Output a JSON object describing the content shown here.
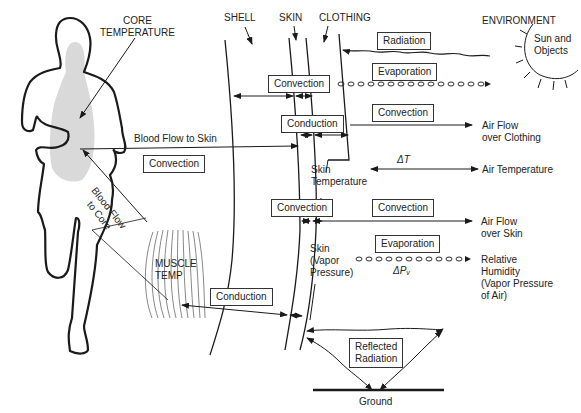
{
  "title_labels": {
    "core_temperature": [
      "CORE",
      "TEMPERATURE"
    ],
    "shell": "SHELL",
    "skin": "SKIN",
    "clothing": "CLOTHING",
    "environment": "ENVIRONMENT",
    "sun_objects": [
      "Sun and",
      "Objects"
    ],
    "muscle_temp": [
      "MUSCLE",
      "TEMP"
    ]
  },
  "boxes": {
    "radiation": "Radiation",
    "convection_top": "Convection",
    "evaporation_top": "Evaporation",
    "conduction_top": "Conduction",
    "convection_clothing": "Convection",
    "convection_blood": "Convection",
    "convection_skin_left": "Convection",
    "convection_skin_right": "Convection",
    "evaporation_skin": "Evaporation",
    "conduction_bottom": "Conduction",
    "reflected_radiation": [
      "Reflected",
      "Radiation"
    ]
  },
  "flow_labels": {
    "blood_to_skin": "Blood Flow to Skin",
    "blood_to_core": [
      "Blood Flow",
      "to Core"
    ],
    "skin_temperature": [
      "Skin",
      "Temperature"
    ],
    "delta_t": "ΔT",
    "skin_vapor": [
      "Skin",
      "(Vapor",
      "Pressure)"
    ],
    "delta_pv": "ΔPᵥ",
    "air_flow_clothing": [
      "Air Flow",
      "over Clothing"
    ],
    "air_temperature": "Air Temperature",
    "air_flow_skin": [
      "Air Flow",
      "over Skin"
    ],
    "humidity": [
      "Relative",
      "Humidity",
      "(Vapor Pressure",
      "of Air)"
    ],
    "ground": "Ground"
  },
  "colors": {
    "line": "#1a1a1a",
    "core_shade": "#d9d9d9"
  }
}
